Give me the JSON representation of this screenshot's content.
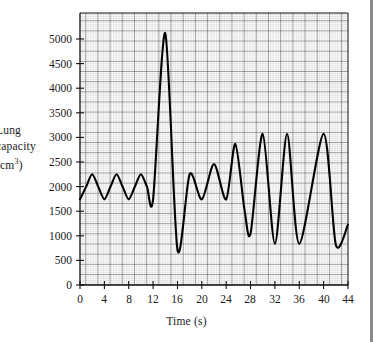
{
  "chart_data": {
    "type": "line",
    "title": "",
    "xlabel": "Time (s)",
    "ylabel_lines": [
      "Lung",
      "capacity",
      "(cm3)"
    ],
    "ylabel": "Lung capacity (cm3)",
    "ylabel_clipped": true,
    "xlim": [
      0,
      44
    ],
    "ylim": [
      0,
      5400
    ],
    "xticks": [
      0,
      4,
      8,
      12,
      16,
      20,
      24,
      28,
      32,
      36,
      40,
      44
    ],
    "yticks": [
      0,
      500,
      1000,
      1500,
      2000,
      2500,
      3000,
      3500,
      4000,
      4500,
      5000
    ],
    "xtick_labels": [
      "0",
      "4",
      "8",
      "12",
      "16",
      "20",
      "24",
      "28",
      "32",
      "36",
      "40",
      "44"
    ],
    "ytick_labels": [
      "0",
      "500",
      "1000",
      "1500",
      "2000",
      "2500",
      "3000",
      "3500",
      "4000",
      "4500",
      "5000"
    ],
    "grid": true,
    "grid_minor_step_x": 0.4,
    "grid_minor_step_y": 100,
    "grid_major_step_x": 2,
    "grid_major_step_y": 500,
    "legend": null,
    "series": [
      {
        "name": "Lung capacity trace",
        "line_color": "#000000",
        "line_width": 2,
        "points": [
          [
            0.0,
            1700
          ],
          [
            1.0,
            1950
          ],
          [
            2.0,
            2200
          ],
          [
            3.0,
            1950
          ],
          [
            4.0,
            1700
          ],
          [
            5.0,
            1950
          ],
          [
            6.0,
            2200
          ],
          [
            7.0,
            1950
          ],
          [
            8.0,
            1700
          ],
          [
            9.0,
            1950
          ],
          [
            10.0,
            2200
          ],
          [
            11.0,
            1950
          ],
          [
            12.0,
            1700
          ],
          [
            14.0,
            5000
          ],
          [
            16.0,
            700
          ],
          [
            17.0,
            1450
          ],
          [
            18.0,
            2200
          ],
          [
            19.0,
            1900
          ],
          [
            20.0,
            1700
          ],
          [
            21.0,
            2050
          ],
          [
            22.0,
            2400
          ],
          [
            23.0,
            2000
          ],
          [
            24.0,
            1700
          ],
          [
            26.0,
            1500
          ],
          [
            25.0,
            2800
          ],
          [
            28.0,
            1000
          ],
          [
            30.0,
            3000
          ],
          [
            32.0,
            820
          ],
          [
            34.0,
            3000
          ],
          [
            36.0,
            820
          ],
          [
            40.0,
            3000
          ],
          [
            42.0,
            800
          ],
          [
            44.0,
            1200
          ]
        ],
        "points_ordered": [
          [
            0.0,
            1700
          ],
          [
            1.0,
            1950
          ],
          [
            2.0,
            2200
          ],
          [
            3.0,
            1950
          ],
          [
            4.0,
            1700
          ],
          [
            5.0,
            1950
          ],
          [
            6.0,
            2200
          ],
          [
            7.0,
            1950
          ],
          [
            8.0,
            1700
          ],
          [
            9.0,
            1950
          ],
          [
            10.0,
            2200
          ],
          [
            11.0,
            1950
          ],
          [
            12.0,
            1700
          ],
          [
            14.0,
            5000
          ],
          [
            16.0,
            700
          ],
          [
            18.0,
            2200
          ],
          [
            20.0,
            1700
          ],
          [
            22.0,
            2400
          ],
          [
            24.0,
            1700
          ],
          [
            25.5,
            2800
          ],
          [
            27.0,
            1500
          ],
          [
            28.0,
            1020
          ],
          [
            30.0,
            3000
          ],
          [
            32.0,
            820
          ],
          [
            34.0,
            3000
          ],
          [
            36.0,
            820
          ],
          [
            40.0,
            3000
          ],
          [
            42.0,
            800
          ],
          [
            44.0,
            1200
          ]
        ],
        "annotations": [
          {
            "label": "quiet breathing",
            "x_range": [
              0,
              12
            ]
          },
          {
            "label": "maximum inhalation peak",
            "x": 14,
            "y": 5000
          },
          {
            "label": "maximum exhalation trough",
            "x": 16,
            "y": 700
          },
          {
            "label": "deep breathing",
            "x_range": [
              28,
              44
            ]
          }
        ]
      }
    ]
  },
  "plot_geometry": {
    "left_px": 80,
    "right_px": 348,
    "top_px": 13,
    "bottom_px": 285
  }
}
